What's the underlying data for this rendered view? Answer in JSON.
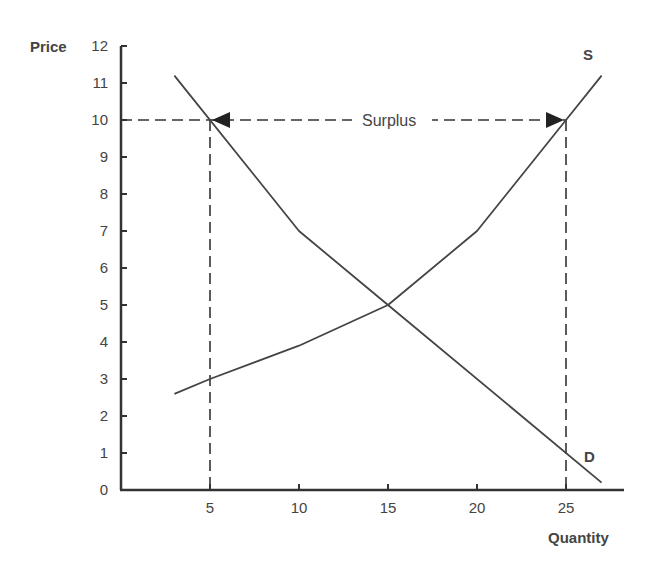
{
  "chart_data": {
    "type": "line",
    "title": "",
    "xlabel": "Quantity",
    "ylabel": "Price",
    "xlim": [
      0,
      28
    ],
    "ylim": [
      0,
      12
    ],
    "x_ticks": [
      5,
      10,
      15,
      20,
      25
    ],
    "y_ticks": [
      0,
      1,
      2,
      3,
      4,
      5,
      6,
      7,
      8,
      9,
      10,
      11,
      12
    ],
    "grid": false,
    "series": [
      {
        "name": "D",
        "label": "D",
        "points": [
          [
            3,
            11.2
          ],
          [
            10,
            7
          ],
          [
            15,
            5
          ],
          [
            27,
            0.2
          ]
        ]
      },
      {
        "name": "S",
        "label": "S",
        "points": [
          [
            3,
            2.6
          ],
          [
            5,
            3
          ],
          [
            10,
            3.9
          ],
          [
            15,
            5
          ],
          [
            20,
            7
          ],
          [
            25,
            10
          ],
          [
            27,
            11.2
          ]
        ]
      }
    ],
    "annotations": [
      {
        "type": "hline-dashed",
        "y": 10,
        "x_from": 0,
        "x_to": 25
      },
      {
        "type": "vline-dashed",
        "x": 5,
        "y_from": 0,
        "y_to": 10
      },
      {
        "type": "vline-dashed",
        "x": 25,
        "y_from": 0,
        "y_to": 10
      },
      {
        "type": "double-arrow",
        "y": 10,
        "x_from": 5,
        "x_to": 25,
        "text": "Surplus"
      }
    ]
  },
  "labels": {
    "y_axis_title": "Price",
    "x_axis_title": "Quantity",
    "supply": "S",
    "demand": "D",
    "surplus": "Surplus",
    "y_ticks": [
      "0",
      "1",
      "2",
      "3",
      "4",
      "5",
      "6",
      "7",
      "8",
      "9",
      "10",
      "11",
      "12"
    ],
    "x_ticks": [
      "5",
      "10",
      "15",
      "20",
      "25"
    ]
  }
}
